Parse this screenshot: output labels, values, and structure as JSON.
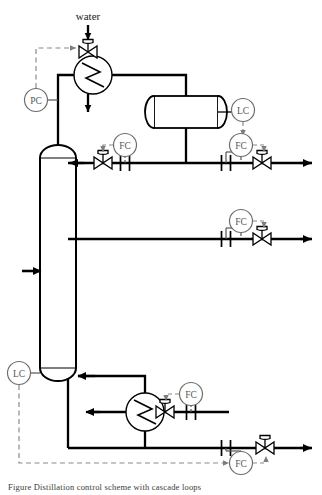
{
  "diagram": {
    "header_note": "",
    "caption": "Figure  Distillation control scheme with cascade loops",
    "stream_labels": {
      "water": "water"
    },
    "colors": {
      "line": "#000000",
      "signal": "#8a8a8a",
      "instrument_text": "#555555",
      "background": "#ffffff"
    },
    "instruments": [
      {
        "id": "pc-top",
        "tag": "PC",
        "name": "pressure-controller",
        "cx": 36,
        "cy": 100
      },
      {
        "id": "lc-drum",
        "tag": "LC",
        "name": "level-controller-drum",
        "cx": 243,
        "cy": 110
      },
      {
        "id": "fc-reflux",
        "tag": "FC",
        "name": "flow-controller-reflux",
        "cx": 125,
        "cy": 148
      },
      {
        "id": "fc-distillate",
        "tag": "FC",
        "name": "flow-controller-distillate",
        "cx": 241,
        "cy": 148
      },
      {
        "id": "fc-sidedraw",
        "tag": "FC",
        "name": "flow-controller-sidedraw",
        "cx": 241,
        "cy": 224
      },
      {
        "id": "lc-bottom",
        "tag": "LC",
        "name": "level-controller-bottoms",
        "cx": 19,
        "cy": 373
      },
      {
        "id": "fc-steam",
        "tag": "FC",
        "name": "flow-controller-steam",
        "cx": 191,
        "cy": 397
      },
      {
        "id": "fc-bottoms",
        "tag": "FC",
        "name": "flow-controller-bottoms",
        "cx": 241,
        "cy": 463
      }
    ],
    "equipment": [
      {
        "id": "column",
        "name": "distillation-column"
      },
      {
        "id": "condenser",
        "name": "condenser-heat-exchanger"
      },
      {
        "id": "drum",
        "name": "reflux-drum"
      },
      {
        "id": "reboiler",
        "name": "reboiler-heat-exchanger"
      }
    ],
    "valves": [
      {
        "id": "v-water",
        "name": "control-valve-cooling-water"
      },
      {
        "id": "v-reflux",
        "name": "control-valve-reflux"
      },
      {
        "id": "v-distillate",
        "name": "control-valve-distillate"
      },
      {
        "id": "v-sidedraw",
        "name": "control-valve-sidedraw"
      },
      {
        "id": "v-steam",
        "name": "control-valve-steam"
      },
      {
        "id": "v-bottoms",
        "name": "control-valve-bottoms"
      }
    ],
    "meters": [
      {
        "id": "fe-reflux",
        "name": "orifice-meter-reflux"
      },
      {
        "id": "fe-distillate",
        "name": "orifice-meter-distillate"
      },
      {
        "id": "fe-sidedraw",
        "name": "orifice-meter-sidedraw"
      },
      {
        "id": "fe-steam",
        "name": "orifice-meter-steam"
      },
      {
        "id": "fe-bottoms",
        "name": "orifice-meter-bottoms"
      }
    ],
    "streams": [
      {
        "id": "s-feed",
        "name": "feed-stream-arrow"
      },
      {
        "id": "s-distillate",
        "name": "distillate-product-arrow"
      },
      {
        "id": "s-sidedraw",
        "name": "sidedraw-product-arrow"
      },
      {
        "id": "s-bottoms",
        "name": "bottoms-product-arrow"
      },
      {
        "id": "s-reflux",
        "name": "reflux-return-arrow"
      },
      {
        "id": "s-steamout",
        "name": "condensate-outlet-arrow"
      },
      {
        "id": "s-vapor",
        "name": "vapor-return-arrow"
      }
    ]
  }
}
